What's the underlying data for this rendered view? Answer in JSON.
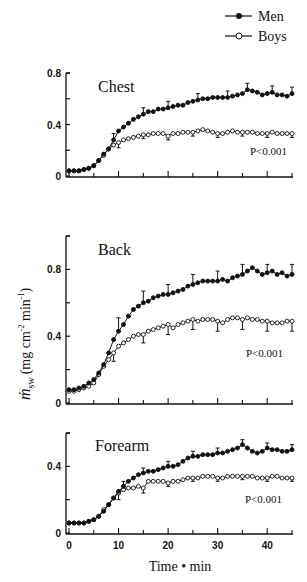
{
  "legend": [
    {
      "name": "Men",
      "marker": "filled-circle"
    },
    {
      "name": "Boys",
      "marker": "open-circle"
    }
  ],
  "ylabel": "ṁsw (mg cm⁻² min⁻¹)",
  "ylabel_parts": {
    "symbol": "ṁ",
    "subscript": "sw",
    "unit": "(mg cm",
    "exp": "-2",
    "unit2": " min",
    "exp2": "-1",
    "close": ")"
  },
  "xlabel": "Time • min",
  "colors": {
    "line": "#111111",
    "background": "#ffffff"
  },
  "chart_data": [
    {
      "type": "line",
      "title": "Chest",
      "annotation": "P<0.001",
      "xlabel": "Time • min",
      "ylabel": "ṁsw (mg cm⁻² min⁻¹)",
      "xlim": [
        0,
        45
      ],
      "ylim": [
        0,
        0.8
      ],
      "yticks": [
        0,
        0.2,
        0.4,
        0.6,
        0.8
      ],
      "ytick_labels": [
        "0",
        "",
        "0.4",
        "",
        "0.8"
      ],
      "xticks": [
        0,
        5,
        10,
        15,
        20,
        25,
        30,
        35,
        40,
        45
      ],
      "x": [
        0,
        1,
        2,
        3,
        4,
        5,
        6,
        7,
        8,
        9,
        10,
        11,
        12,
        13,
        14,
        15,
        16,
        17,
        18,
        19,
        20,
        21,
        22,
        23,
        24,
        25,
        26,
        27,
        28,
        29,
        30,
        31,
        32,
        33,
        34,
        35,
        36,
        37,
        38,
        39,
        40,
        41,
        42,
        43,
        44,
        45
      ],
      "series": [
        {
          "name": "Men",
          "values": [
            0.04,
            0.04,
            0.04,
            0.05,
            0.06,
            0.08,
            0.12,
            0.17,
            0.21,
            0.28,
            0.35,
            0.38,
            0.41,
            0.44,
            0.46,
            0.48,
            0.5,
            0.5,
            0.52,
            0.52,
            0.53,
            0.54,
            0.55,
            0.55,
            0.57,
            0.58,
            0.59,
            0.6,
            0.6,
            0.61,
            0.61,
            0.61,
            0.61,
            0.62,
            0.63,
            0.64,
            0.67,
            0.66,
            0.65,
            0.63,
            0.64,
            0.65,
            0.63,
            0.63,
            0.62,
            0.64
          ],
          "error_bars_at": [
            9,
            15,
            20,
            26,
            32,
            36,
            41,
            45
          ],
          "error": [
            0.05,
            0.05,
            0.05,
            0.05,
            0.05,
            0.05,
            0.05,
            0.05
          ]
        },
        {
          "name": "Boys",
          "values": [
            0.04,
            0.04,
            0.04,
            0.05,
            0.06,
            0.08,
            0.12,
            0.16,
            0.21,
            0.24,
            0.26,
            0.28,
            0.29,
            0.3,
            0.31,
            0.32,
            0.32,
            0.33,
            0.33,
            0.33,
            0.31,
            0.33,
            0.33,
            0.34,
            0.34,
            0.34,
            0.35,
            0.36,
            0.35,
            0.34,
            0.33,
            0.33,
            0.34,
            0.35,
            0.34,
            0.34,
            0.34,
            0.34,
            0.33,
            0.33,
            0.33,
            0.34,
            0.33,
            0.33,
            0.33,
            0.33
          ],
          "error_bars_at": [
            10,
            15,
            20,
            25,
            30,
            35,
            40,
            45
          ],
          "error": [
            0.04,
            0.03,
            0.03,
            0.03,
            0.03,
            0.03,
            0.03,
            0.03
          ]
        }
      ]
    },
    {
      "type": "line",
      "title": "Back",
      "annotation": "P<0.001",
      "xlabel": "Time • min",
      "ylabel": "ṁsw (mg cm⁻² min⁻¹)",
      "xlim": [
        0,
        45
      ],
      "ylim": [
        0,
        1.0
      ],
      "yticks": [
        0,
        0.2,
        0.4,
        0.6,
        0.8,
        1.0
      ],
      "ytick_labels": [
        "0",
        "",
        "0.4",
        "",
        "0.8",
        ""
      ],
      "xticks": [
        0,
        5,
        10,
        15,
        20,
        25,
        30,
        35,
        40,
        45
      ],
      "x": [
        0,
        1,
        2,
        3,
        4,
        5,
        6,
        7,
        8,
        9,
        10,
        11,
        12,
        13,
        14,
        15,
        16,
        17,
        18,
        19,
        20,
        21,
        22,
        23,
        24,
        25,
        26,
        27,
        28,
        29,
        30,
        31,
        32,
        33,
        34,
        35,
        36,
        37,
        38,
        39,
        40,
        41,
        42,
        43,
        44,
        45
      ],
      "series": [
        {
          "name": "Men",
          "values": [
            0.08,
            0.08,
            0.09,
            0.1,
            0.12,
            0.14,
            0.18,
            0.23,
            0.3,
            0.38,
            0.43,
            0.47,
            0.52,
            0.56,
            0.58,
            0.6,
            0.61,
            0.63,
            0.64,
            0.65,
            0.65,
            0.66,
            0.67,
            0.68,
            0.7,
            0.71,
            0.72,
            0.73,
            0.73,
            0.73,
            0.73,
            0.74,
            0.73,
            0.75,
            0.76,
            0.77,
            0.79,
            0.81,
            0.79,
            0.77,
            0.78,
            0.79,
            0.77,
            0.78,
            0.76,
            0.77
          ],
          "error_bars_at": [
            10,
            15,
            20,
            25,
            30,
            35,
            40,
            45
          ],
          "error": [
            0.08,
            0.07,
            0.06,
            0.06,
            0.06,
            0.06,
            0.05,
            0.06
          ]
        },
        {
          "name": "Boys",
          "values": [
            0.07,
            0.07,
            0.08,
            0.09,
            0.1,
            0.12,
            0.17,
            0.22,
            0.26,
            0.3,
            0.34,
            0.36,
            0.38,
            0.4,
            0.41,
            0.41,
            0.43,
            0.44,
            0.45,
            0.46,
            0.47,
            0.45,
            0.47,
            0.48,
            0.49,
            0.5,
            0.49,
            0.5,
            0.5,
            0.5,
            0.49,
            0.48,
            0.5,
            0.51,
            0.51,
            0.5,
            0.51,
            0.5,
            0.5,
            0.49,
            0.49,
            0.48,
            0.48,
            0.48,
            0.49,
            0.49
          ],
          "error_bars_at": [
            9,
            15,
            20,
            25,
            30,
            35,
            40,
            45
          ],
          "error": [
            0.05,
            0.05,
            0.06,
            0.06,
            0.06,
            0.06,
            0.06,
            0.06
          ]
        }
      ]
    },
    {
      "type": "line",
      "title": "Forearm",
      "annotation": "P<0.001",
      "xlabel": "Time • min",
      "ylabel": "ṁsw (mg cm⁻² min⁻¹)",
      "xlim": [
        0,
        45
      ],
      "ylim": [
        0,
        0.6
      ],
      "yticks": [
        0,
        0.2,
        0.4,
        0.6
      ],
      "ytick_labels": [
        "0",
        "",
        "0.4",
        ""
      ],
      "xticks": [
        0,
        5,
        10,
        15,
        20,
        25,
        30,
        35,
        40,
        45
      ],
      "xtick_labels": [
        "0",
        "",
        "10",
        "",
        "20",
        "",
        "30",
        "",
        "40",
        ""
      ],
      "x": [
        0,
        1,
        2,
        3,
        4,
        5,
        6,
        7,
        8,
        9,
        10,
        11,
        12,
        13,
        14,
        15,
        16,
        17,
        18,
        19,
        20,
        21,
        22,
        23,
        24,
        25,
        26,
        27,
        28,
        29,
        30,
        31,
        32,
        33,
        34,
        35,
        36,
        37,
        38,
        39,
        40,
        41,
        42,
        43,
        44,
        45
      ],
      "series": [
        {
          "name": "Men",
          "values": [
            0.06,
            0.06,
            0.06,
            0.06,
            0.07,
            0.08,
            0.1,
            0.13,
            0.17,
            0.21,
            0.25,
            0.28,
            0.31,
            0.33,
            0.35,
            0.36,
            0.37,
            0.37,
            0.38,
            0.39,
            0.4,
            0.4,
            0.41,
            0.43,
            0.45,
            0.46,
            0.46,
            0.47,
            0.47,
            0.47,
            0.48,
            0.48,
            0.49,
            0.5,
            0.51,
            0.53,
            0.51,
            0.49,
            0.48,
            0.49,
            0.51,
            0.5,
            0.5,
            0.49,
            0.49,
            0.5
          ],
          "error_bars_at": [
            11,
            15,
            20,
            25,
            30,
            35,
            40,
            45
          ],
          "error": [
            0.03,
            0.03,
            0.03,
            0.03,
            0.03,
            0.03,
            0.03,
            0.03
          ]
        },
        {
          "name": "Boys",
          "values": [
            0.06,
            0.06,
            0.06,
            0.06,
            0.07,
            0.08,
            0.1,
            0.14,
            0.17,
            0.21,
            0.24,
            0.26,
            0.27,
            0.27,
            0.28,
            0.27,
            0.31,
            0.31,
            0.31,
            0.31,
            0.3,
            0.31,
            0.31,
            0.32,
            0.33,
            0.33,
            0.33,
            0.34,
            0.34,
            0.34,
            0.33,
            0.33,
            0.34,
            0.34,
            0.34,
            0.34,
            0.34,
            0.34,
            0.33,
            0.33,
            0.33,
            0.34,
            0.34,
            0.33,
            0.33,
            0.33
          ],
          "error_bars_at": [
            10,
            15,
            20,
            25,
            30,
            35,
            40,
            45
          ],
          "error": [
            0.04,
            0.03,
            0.02,
            0.02,
            0.02,
            0.02,
            0.02,
            0.02
          ]
        }
      ]
    }
  ],
  "layout": {
    "x0px": 69,
    "x1px": 292,
    "panels": [
      {
        "y0px": 176,
        "ytoppx": 73,
        "yTopVal": 0.8,
        "titleX": 98,
        "titleY": 92,
        "pX": 250,
        "pY": 155
      },
      {
        "y0px": 403,
        "ytoppx": 236,
        "yTopVal": 1.0,
        "titleX": 98,
        "titleY": 255,
        "pX": 246,
        "pY": 357
      },
      {
        "y0px": 533,
        "ytoppx": 433,
        "yTopVal": 0.6,
        "titleX": 95,
        "titleY": 451,
        "pX": 245,
        "pY": 503
      }
    ]
  }
}
